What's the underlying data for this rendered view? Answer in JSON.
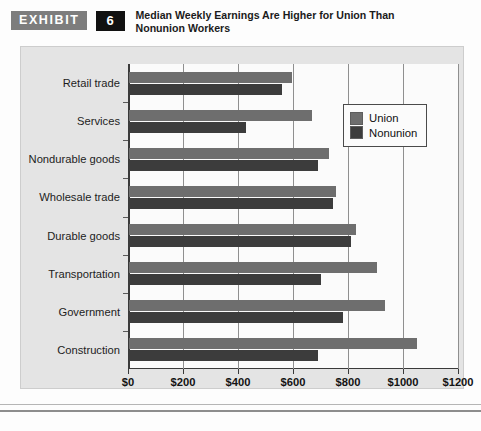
{
  "header": {
    "exhibit_label": "EXHIBIT",
    "exhibit_number": "6",
    "title": "Median Weekly Earnings Are Higher for Union Than Nonunion Workers"
  },
  "legend": {
    "union_label": "Union",
    "nonunion_label": "Nonunion"
  },
  "colors": {
    "union": "#6e6e6e",
    "nonunion": "#3c3c3c",
    "panel_background": "#e4e4e4",
    "plot_background": "#fbfbfb",
    "axis": "#3a3a3a",
    "gridline": "#8f8f8f",
    "exhibit_badge": "#7d7d7d",
    "number_badge": "#111111"
  },
  "chart_data": {
    "type": "bar",
    "orientation": "horizontal",
    "title": "Median Weekly Earnings Are Higher for Union Than Nonunion Workers",
    "xlabel": "",
    "ylabel": "",
    "xlim": [
      0,
      1200
    ],
    "xticks": [
      0,
      200,
      400,
      600,
      800,
      1000,
      1200
    ],
    "xtick_labels": [
      "$0",
      "$200",
      "$400",
      "$600",
      "$800",
      "$1000",
      "$1200"
    ],
    "grid": true,
    "legend_position": "upper right",
    "categories": [
      "Retail trade",
      "Services",
      "Nondurable goods",
      "Wholesale trade",
      "Durable goods",
      "Transportation",
      "Government",
      "Construction"
    ],
    "series": [
      {
        "name": "Union",
        "values": [
          595,
          670,
          730,
          755,
          830,
          905,
          935,
          1050
        ]
      },
      {
        "name": "Nonunion",
        "values": [
          560,
          430,
          690,
          745,
          810,
          700,
          780,
          690
        ]
      }
    ]
  }
}
